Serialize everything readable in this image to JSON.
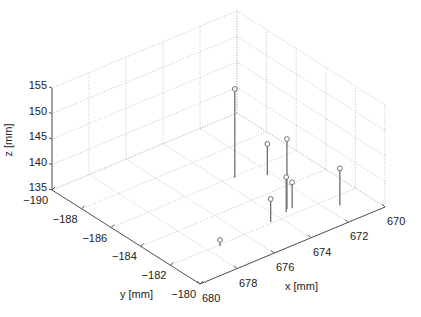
{
  "chart_data": {
    "type": "scatter",
    "subtype": "stem3",
    "title": "",
    "xlabel": "x [mm]",
    "ylabel": "y [mm]",
    "zlabel": "z [mm]",
    "xlim": [
      670,
      680
    ],
    "ylim": [
      -190,
      -180
    ],
    "zlim": [
      135,
      155
    ],
    "xticks": [
      670,
      672,
      674,
      676,
      678,
      680
    ],
    "yticks": [
      -190,
      -188,
      -186,
      -184,
      -182,
      -180
    ],
    "zticks": [
      135,
      140,
      145,
      150,
      155
    ],
    "xtick_labels": [
      "670",
      "672",
      "674",
      "676",
      "678",
      "680"
    ],
    "ytick_labels": [
      "−190",
      "−188",
      "−186",
      "−184",
      "−182",
      "−180"
    ],
    "ztick_labels": [
      "135",
      "140",
      "145",
      "150",
      "155"
    ],
    "grid": true,
    "points": [
      {
        "x": 673.4,
        "y": -185.9,
        "z": 152.4
      },
      {
        "x": 672.2,
        "y": -185.2,
        "z": 141.1
      },
      {
        "x": 673.3,
        "y": -182.5,
        "z": 148.7
      },
      {
        "x": 673.5,
        "y": -182.3,
        "z": 141.9
      },
      {
        "x": 673.1,
        "y": -182.4,
        "z": 140.1
      },
      {
        "x": 674.5,
        "y": -182.1,
        "z": 139.5
      },
      {
        "x": 671.4,
        "y": -181.3,
        "z": 142.3
      },
      {
        "x": 677.4,
        "y": -181.9,
        "z": 136.2
      }
    ]
  }
}
